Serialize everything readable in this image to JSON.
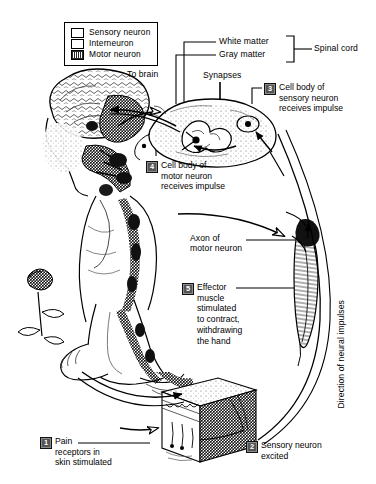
{
  "diagram": {
    "legend": {
      "items": [
        {
          "label": "Sensory neuron",
          "swatch": "open-white-box",
          "color": "#ffffff"
        },
        {
          "label": "Interneuron",
          "swatch": "open-white-box",
          "color": "#ffffff"
        },
        {
          "label": "Motor neuron",
          "swatch": "filled-dark-box",
          "color": "#2a2a2a"
        }
      ]
    },
    "labels": {
      "white_matter": "White matter",
      "gray_matter": "Gray matter",
      "spinal_cord": "Spinal cord",
      "to_brain": "To brain",
      "synapses": "Synapses",
      "axon_of_motor_neuron": "Axon of\nmotor neuron",
      "direction_of_impulses": "Direction of neural impulses"
    },
    "steps": [
      {
        "num": "1",
        "text": "Pain\nreceptors in\nskin stimulated"
      },
      {
        "num": "2",
        "text": "Sensory neuron\nexcited"
      },
      {
        "num": "3",
        "text": "Cell body of\nsensory neuron\nreceives impulse"
      },
      {
        "num": "4",
        "text": "Cell body of\nmotor neuron\nreceives impulse"
      },
      {
        "num": "5",
        "text": "Effector\nmuscle\nstimulated\nto contract,\nwithdrawing\nthe hand"
      }
    ],
    "illustrations": [
      {
        "name": "head-brain-arm-figure"
      },
      {
        "name": "spinal-cord-cross-section"
      },
      {
        "name": "muscle-effector"
      },
      {
        "name": "skin-cross-section-block"
      },
      {
        "name": "hand-and-rose"
      }
    ],
    "colors": {
      "ink": "#000000",
      "paper": "#ffffff",
      "number_badge": "#555555"
    }
  }
}
